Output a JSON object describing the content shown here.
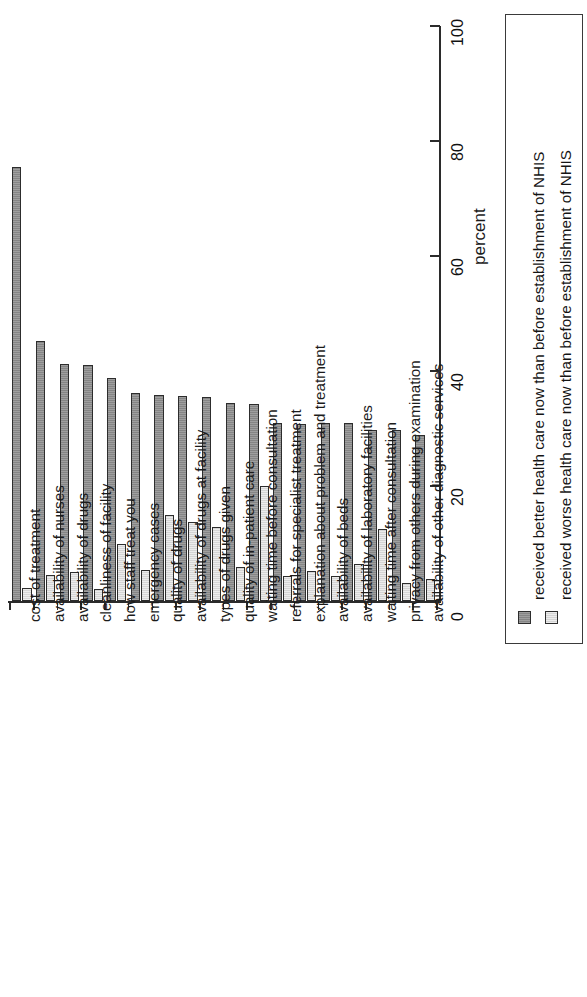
{
  "chart_data": {
    "type": "bar",
    "orientation": "rotated-90",
    "title": "",
    "xlabel": "",
    "ylabel": "percent",
    "ylim": [
      0,
      100
    ],
    "yticks": [
      0,
      20,
      40,
      60,
      80,
      100
    ],
    "grid": false,
    "legend_position": "right",
    "categories": [
      "cost of treatment",
      "availability of nurses",
      "availability of drugs",
      "cleanliness of facility",
      "how staff treat you",
      "emergency cases",
      "quality of drugs",
      "availability of drugs at facility",
      "types of drugs given",
      "quality of in-patient care",
      "waiting time before consultation",
      "referrals for specialist treatment",
      "explanation about problem and treatment",
      "availability of beds",
      "availability of laboratory facilities",
      "waiting time after consultation",
      "privacy from others during examination",
      "availability of other diagnostic services"
    ],
    "series": [
      {
        "name": "received better health care now than before establishment of NHIS",
        "color": "#8d8d8d",
        "values": [
          75.4,
          45.3,
          41.2,
          41.0,
          38.8,
          36.2,
          35.8,
          35.6,
          35.4,
          34.4,
          34.3,
          31.0,
          30.8,
          30.9,
          30.9,
          29.8,
          29.7,
          28.9
        ]
      },
      {
        "name": "received worse health care now than before establishment of NHIS",
        "color": "#dddddd",
        "values": [
          2.3,
          4.6,
          5.0,
          2.1,
          10.0,
          5.4,
          14.9,
          13.7,
          12.9,
          6.0,
          20.0,
          4.4,
          5.2,
          4.3,
          6.4,
          12.6,
          3.2,
          3.9
        ]
      }
    ]
  },
  "axis": {
    "tick_labels": [
      "0",
      "20",
      "40",
      "60",
      "80",
      "100"
    ],
    "title": "percent"
  },
  "legend": {
    "entries": [
      {
        "swatch": "better-swatch",
        "label": "received better health care now than before establishment of NHIS"
      },
      {
        "swatch": "worse-swatch",
        "label": "received worse health care now than before establishment of NHIS"
      }
    ]
  }
}
